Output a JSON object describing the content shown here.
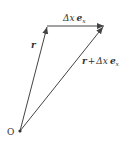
{
  "diagram": {
    "type": "vector-addition",
    "origin_label": "O",
    "vectors": [
      {
        "name": "r",
        "from": [
          20,
          131
        ],
        "to": [
          47,
          26
        ],
        "label": "r"
      },
      {
        "name": "dx_ex",
        "from": [
          47,
          26
        ],
        "to": [
          104,
          26
        ],
        "label": "Δx e_x"
      },
      {
        "name": "r_plus_dx_ex",
        "from": [
          20,
          131
        ],
        "to": [
          104,
          26
        ],
        "label": "r + Δx e_x"
      }
    ],
    "labels": {
      "origin": "O",
      "r": "r",
      "delta": "Δx",
      "ex_base": "e",
      "ex_sub": "x",
      "plus": "+"
    },
    "colors": {
      "line": "#444444",
      "text": "#333333"
    }
  }
}
